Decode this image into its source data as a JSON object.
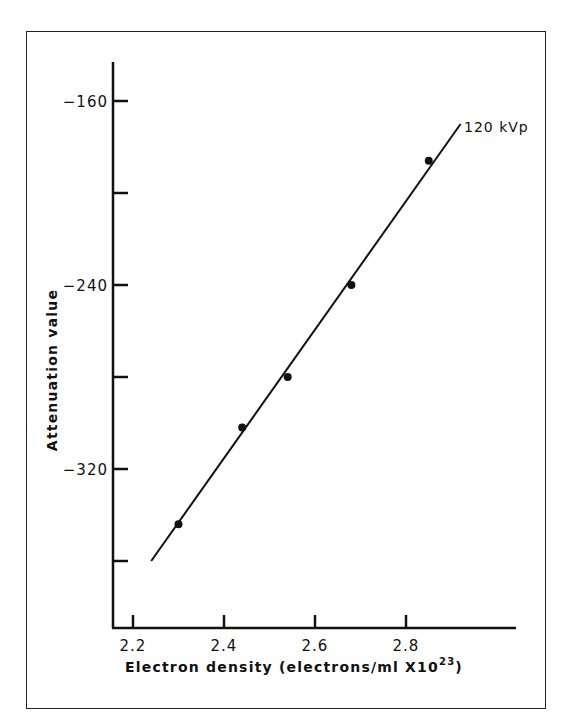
{
  "chart_data": {
    "type": "scatter",
    "title": "",
    "xlabel": "Electron density (electrons/ml X10",
    "xlabel_superscript": "23",
    "xlabel_close": ")",
    "ylabel": "Attenuation value",
    "xlim": [
      2.12,
      3.0
    ],
    "ylim": [
      -380,
      -140
    ],
    "x_ticks": [
      2.2,
      2.4,
      2.6,
      2.8
    ],
    "x_tick_labels": [
      "2.2",
      "2.4",
      "2.6",
      "2.8"
    ],
    "y_ticks": [
      -160,
      -200,
      -240,
      -280,
      -320,
      -360
    ],
    "y_tick_labels": [
      "-160",
      "",
      "-240",
      "",
      "-320",
      ""
    ],
    "grid": false,
    "legend": "none",
    "series": [
      {
        "name": "120 kVp",
        "type": "scatter",
        "points": [
          {
            "x": 2.3,
            "y": -344
          },
          {
            "x": 2.44,
            "y": -302
          },
          {
            "x": 2.54,
            "y": -280
          },
          {
            "x": 2.68,
            "y": -240
          },
          {
            "x": 2.85,
            "y": -186
          }
        ]
      },
      {
        "name": "120 kVp fit line",
        "type": "line",
        "points": [
          {
            "x": 2.24,
            "y": -360
          },
          {
            "x": 2.92,
            "y": -170
          }
        ]
      }
    ],
    "annotations": [
      {
        "text": "120 kVp",
        "x": 2.92,
        "y": -170
      }
    ]
  },
  "labels": {
    "series_label": "120 kVp"
  }
}
